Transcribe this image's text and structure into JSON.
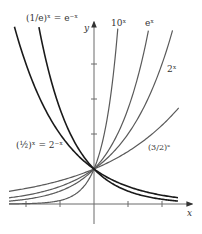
{
  "chart_data": {
    "type": "line",
    "title": "",
    "xlabel": "x",
    "ylabel": "y",
    "xlim": [
      -2.5,
      2.9
    ],
    "ylim": [
      0,
      5.3
    ],
    "grid": false,
    "legend": "inline labels",
    "x_ticks": [
      -2,
      -1,
      1,
      2
    ],
    "y_ticks": [
      2,
      3,
      4
    ],
    "intersection_point": [
      0,
      1
    ],
    "series": [
      {
        "name": "(3/2)^x",
        "label": "(3/2)ˣ",
        "base": 1.5,
        "x_range": [
          -2.5,
          2.49
        ],
        "style": "gray"
      },
      {
        "name": "2^x",
        "label": "2ˣ",
        "base": 2,
        "x_range": [
          -2.5,
          2.31
        ],
        "style": "gray"
      },
      {
        "name": "e^x",
        "label": "eˣ",
        "base": 2.718281828,
        "x_range": [
          -2.5,
          1.6
        ],
        "style": "gray"
      },
      {
        "name": "10^x",
        "label": "10ˣ",
        "base": 10,
        "x_range": [
          -2.5,
          0.7
        ],
        "style": "gray"
      },
      {
        "name": "(1/2)^x = 2^-x",
        "label": "(½)ˣ = 2⁻ˣ",
        "base": 0.5,
        "x_range": [
          -2.34,
          2.47
        ],
        "style": "black"
      },
      {
        "name": "(1/e)^x = e^-x",
        "label": "(1/e)ˣ = e⁻ˣ",
        "base": 0.367879441,
        "x_range": [
          -1.62,
          2.47
        ],
        "style": "black"
      }
    ],
    "plot": {
      "origin_px": [
        94,
        204
      ],
      "unit_x_px": 34,
      "unit_y_px": 35,
      "colors": {
        "gray": "#5a5a5a",
        "black": "#1a1a1a",
        "axis": "#6a6a6a"
      }
    }
  },
  "labels": {
    "x_axis": "x",
    "y_axis": "y",
    "inv_e": "(1/e)ˣ = e⁻ˣ",
    "ten": "10ˣ",
    "e": "eˣ",
    "two": "2ˣ",
    "half": "(½)ˣ = 2⁻ˣ",
    "three_halves": "(3/2)ˣ"
  }
}
